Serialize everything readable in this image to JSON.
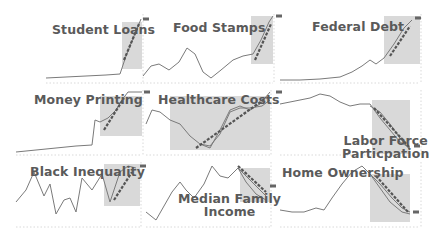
{
  "colors": {
    "line": "#7a7a7a",
    "trend": "#555555",
    "shade": "#d9d9d9",
    "title": "#5a5a5a",
    "axis": "#cfcfcf",
    "marker": "#666666"
  },
  "chart_data": [
    {
      "type": "line",
      "title": "Student Loans",
      "box": [
        46,
        14,
        96,
        68
      ],
      "shade": [
        76,
        8,
        96,
        55
      ],
      "title_pos": [
        6,
        9
      ],
      "series": [
        {
          "name": "actual",
          "values": [
            [
              0,
              64
            ],
            [
              20,
              63
            ],
            [
              40,
              62
            ],
            [
              60,
              61
            ],
            [
              74,
              60
            ],
            [
              80,
              42
            ],
            [
              88,
              22
            ],
            [
              95,
              5
            ]
          ]
        }
      ],
      "trend": [
        [
          78,
          46
        ],
        [
          93,
          10
        ]
      ],
      "marker": [
        97,
        5
      ],
      "xlabel": "",
      "ylabel": "",
      "grid": false,
      "legend": "none"
    },
    {
      "type": "line",
      "title": "Food Stamps",
      "box": [
        143,
        14,
        130,
        68
      ],
      "shade": [
        108,
        2,
        130,
        50
      ],
      "title_pos": [
        30,
        7
      ],
      "series": [
        {
          "name": "actual",
          "values": [
            [
              0,
              62
            ],
            [
              8,
              52
            ],
            [
              16,
              50
            ],
            [
              26,
              56
            ],
            [
              36,
              48
            ],
            [
              44,
              34
            ],
            [
              52,
              40
            ],
            [
              60,
              58
            ],
            [
              68,
              64
            ],
            [
              78,
              56
            ],
            [
              90,
              46
            ],
            [
              100,
              42
            ],
            [
              110,
              40
            ],
            [
              118,
              26
            ],
            [
              126,
              8
            ],
            [
              130,
              2
            ]
          ]
        }
      ],
      "trend": [
        [
          112,
          46
        ],
        [
          128,
          10
        ]
      ],
      "marker": [
        133,
        2
      ],
      "xlabel": "",
      "ylabel": "",
      "grid": false,
      "legend": "none"
    },
    {
      "type": "line",
      "title": "Federal Debt",
      "box": [
        280,
        14,
        140,
        68
      ],
      "shade": [
        104,
        2,
        140,
        50
      ],
      "title_pos": [
        32,
        6
      ],
      "series": [
        {
          "name": "actual",
          "values": [
            [
              0,
              66
            ],
            [
              20,
              66
            ],
            [
              40,
              65
            ],
            [
              60,
              63
            ],
            [
              72,
              58
            ],
            [
              82,
              52
            ],
            [
              90,
              46
            ],
            [
              96,
              50
            ],
            [
              104,
              44
            ],
            [
              114,
              30
            ],
            [
              124,
              14
            ],
            [
              132,
              6
            ]
          ]
        }
      ],
      "trend": [
        [
          110,
          42
        ],
        [
          130,
          12
        ]
      ],
      "marker": [
        135,
        4
      ],
      "xlabel": "",
      "ylabel": "",
      "grid": false,
      "legend": "none"
    },
    {
      "type": "line",
      "title": "Money Printing",
      "box": [
        16,
        90,
        126,
        64
      ],
      "shade": [
        84,
        6,
        126,
        46
      ],
      "title_pos": [
        18,
        3
      ],
      "series": [
        {
          "name": "actual",
          "values": [
            [
              0,
              62
            ],
            [
              20,
              60
            ],
            [
              40,
              58
            ],
            [
              60,
              56
            ],
            [
              76,
              55
            ],
            [
              79,
              30
            ],
            [
              84,
              32
            ],
            [
              92,
              28
            ],
            [
              100,
              20
            ],
            [
              106,
              10
            ],
            [
              112,
              2
            ],
            [
              126,
              2
            ]
          ]
        }
      ],
      "trend": [
        [
          88,
          40
        ],
        [
          108,
          8
        ]
      ],
      "marker": [
        128,
        2
      ],
      "xlabel": "",
      "ylabel": "",
      "grid": false,
      "legend": "none"
    },
    {
      "type": "line",
      "title": "Healthcare Costs",
      "box": [
        146,
        90,
        124,
        64
      ],
      "shade": [
        24,
        6,
        124,
        60
      ],
      "title_pos": [
        12,
        3
      ],
      "series": [
        {
          "name": "actual-a",
          "values": [
            [
              0,
              34
            ],
            [
              6,
              20
            ],
            [
              14,
              22
            ],
            [
              24,
              30
            ],
            [
              34,
              34
            ],
            [
              44,
              46
            ],
            [
              54,
              54
            ],
            [
              64,
              58
            ],
            [
              74,
              40
            ],
            [
              84,
              20
            ],
            [
              94,
              16
            ],
            [
              104,
              20
            ],
            [
              114,
              14
            ],
            [
              124,
              2
            ]
          ]
        },
        {
          "name": "actual-b",
          "values": [
            [
              54,
              54
            ],
            [
              64,
              56
            ],
            [
              74,
              44
            ],
            [
              84,
              22
            ],
            [
              94,
              18
            ],
            [
              104,
              18
            ],
            [
              116,
              16
            ],
            [
              124,
              10
            ]
          ]
        }
      ],
      "trend": [
        [
          50,
          58
        ],
        [
          120,
          8
        ]
      ],
      "marker": [
        130,
        2
      ],
      "xlabel": "",
      "ylabel": "",
      "grid": false,
      "legend": "none"
    },
    {
      "type": "line",
      "title": "Labor Force Particpation",
      "box": [
        280,
        90,
        140,
        64
      ],
      "shade": [
        92,
        10,
        130,
        64
      ],
      "title_pos": [
        62,
        44
      ],
      "series": [
        {
          "name": "actual-a",
          "values": [
            [
              0,
              14
            ],
            [
              10,
              12
            ],
            [
              20,
              10
            ],
            [
              30,
              8
            ],
            [
              40,
              4
            ],
            [
              50,
              6
            ],
            [
              60,
              12
            ],
            [
              70,
              16
            ],
            [
              80,
              14
            ],
            [
              90,
              14
            ],
            [
              100,
              28
            ],
            [
              110,
              40
            ],
            [
              120,
              52
            ],
            [
              130,
              58
            ]
          ]
        },
        {
          "name": "actual-b",
          "values": [
            [
              90,
              16
            ],
            [
              100,
              22
            ],
            [
              110,
              34
            ],
            [
              120,
              48
            ],
            [
              130,
              60
            ]
          ]
        }
      ],
      "trend": [
        [
          94,
          18
        ],
        [
          130,
          58
        ]
      ],
      "marker": [
        134,
        56
      ],
      "xlabel": "",
      "ylabel": "",
      "grid": false,
      "legend": "none"
    },
    {
      "type": "line",
      "title": "Black Inequality",
      "box": [
        16,
        162,
        124,
        64
      ],
      "shade": [
        88,
        2,
        124,
        44
      ],
      "title_pos": [
        14,
        3
      ],
      "series": [
        {
          "name": "actual",
          "values": [
            [
              0,
              40
            ],
            [
              10,
              28
            ],
            [
              18,
              10
            ],
            [
              28,
              34
            ],
            [
              34,
              22
            ],
            [
              40,
              52
            ],
            [
              48,
              38
            ],
            [
              54,
              36
            ],
            [
              60,
              50
            ],
            [
              66,
              16
            ],
            [
              76,
              28
            ],
            [
              86,
              12
            ],
            [
              94,
              40
            ],
            [
              104,
              10
            ],
            [
              112,
              4
            ],
            [
              120,
              6
            ]
          ]
        }
      ],
      "trend": [
        [
          98,
          38
        ],
        [
          116,
          10
        ]
      ],
      "marker": [
        124,
        4
      ],
      "xlabel": "",
      "ylabel": "",
      "grid": false,
      "legend": "none"
    },
    {
      "type": "line",
      "title": "Median Family Income",
      "box": [
        146,
        162,
        124,
        64
      ],
      "shade": [
        94,
        6,
        124,
        40
      ],
      "title_pos": [
        32,
        30
      ],
      "series": [
        {
          "name": "actual-a",
          "values": [
            [
              0,
              50
            ],
            [
              10,
              58
            ],
            [
              18,
              44
            ],
            [
              26,
              30
            ],
            [
              34,
              20
            ],
            [
              40,
              28
            ],
            [
              48,
              36
            ],
            [
              58,
              22
            ],
            [
              66,
              4
            ],
            [
              74,
              14
            ],
            [
              82,
              16
            ],
            [
              92,
              6
            ],
            [
              100,
              20
            ],
            [
              110,
              32
            ],
            [
              120,
              38
            ]
          ]
        },
        {
          "name": "actual-b",
          "values": [
            [
              92,
              6
            ],
            [
              100,
              14
            ],
            [
              110,
              24
            ],
            [
              120,
              34
            ]
          ]
        }
      ],
      "trend": [
        [
          92,
          4
        ],
        [
          120,
          30
        ]
      ],
      "marker": [
        124,
        24
      ],
      "xlabel": "",
      "ylabel": "",
      "grid": false,
      "legend": "none"
    },
    {
      "type": "line",
      "title": "Home Ownership",
      "box": [
        280,
        162,
        140,
        64
      ],
      "shade": [
        90,
        12,
        130,
        60
      ],
      "title_pos": [
        2,
        4
      ],
      "series": [
        {
          "name": "actual-a",
          "values": [
            [
              0,
              48
            ],
            [
              12,
              50
            ],
            [
              24,
              50
            ],
            [
              36,
              46
            ],
            [
              44,
              48
            ],
            [
              52,
              36
            ],
            [
              62,
              22
            ],
            [
              72,
              10
            ],
            [
              82,
              4
            ],
            [
              90,
              12
            ],
            [
              100,
              26
            ],
            [
              110,
              40
            ],
            [
              122,
              50
            ],
            [
              130,
              52
            ]
          ]
        },
        {
          "name": "actual-b",
          "values": [
            [
              90,
              12
            ],
            [
              100,
              22
            ],
            [
              112,
              36
            ],
            [
              122,
              46
            ],
            [
              130,
              50
            ]
          ]
        }
      ],
      "trend": [
        [
          96,
          14
        ],
        [
          128,
          50
        ]
      ],
      "marker": [
        133,
        50
      ],
      "xlabel": "",
      "ylabel": "",
      "grid": false,
      "legend": "none"
    }
  ]
}
